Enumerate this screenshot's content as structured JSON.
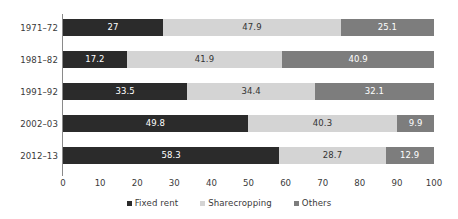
{
  "chart_data": {
    "type": "bar",
    "orientation": "horizontal",
    "stacked": true,
    "stack_total": 100,
    "title": "",
    "subtitle": "",
    "xlabel": "",
    "ylabel": "",
    "xlim": [
      0,
      100
    ],
    "xticks": [
      0,
      10,
      20,
      30,
      40,
      50,
      60,
      70,
      80,
      90,
      100
    ],
    "xtick_labels": [
      "0",
      "10",
      "20",
      "30",
      "40",
      "50",
      "60",
      "70",
      "80",
      "90",
      "100"
    ],
    "grid": false,
    "legend_position": "bottom",
    "categories": [
      "1971–72",
      "1981–82",
      "1991–92",
      "2002–03",
      "2012–13"
    ],
    "series": [
      {
        "name": "Fixed rent",
        "color": "#2b2b2b",
        "label_color": "#ffffff",
        "values": [
          27,
          17.2,
          33.5,
          49.8,
          58.3
        ],
        "value_labels": [
          "27",
          "17.2",
          "33.5",
          "49.8",
          "58.3"
        ]
      },
      {
        "name": "Sharecropping",
        "color": "#d4d4d4",
        "label_color": "#333333",
        "values": [
          47.9,
          41.9,
          34.4,
          40.3,
          28.7
        ],
        "value_labels": [
          "47.9",
          "41.9",
          "34.4",
          "40.3",
          "28.7"
        ]
      },
      {
        "name": "Others",
        "color": "#7d7d7d",
        "label_color": "#ffffff",
        "values": [
          25.1,
          40.9,
          32.1,
          9.9,
          12.9
        ],
        "value_labels": [
          "25.1",
          "40.9",
          "32.1",
          "9.9",
          "12.9"
        ]
      }
    ]
  },
  "legend": {
    "items": [
      {
        "label": "Fixed rent",
        "color": "#2b2b2b"
      },
      {
        "label": "Sharecropping",
        "color": "#d4d4d4"
      },
      {
        "label": "Others",
        "color": "#7d7d7d"
      }
    ]
  },
  "colors": {
    "fixed_rent": "#2b2b2b",
    "sharecropping": "#d4d4d4",
    "others": "#7d7d7d",
    "axis": "#8a8a8a",
    "text": "#3a3a3a",
    "background": "#ffffff"
  }
}
